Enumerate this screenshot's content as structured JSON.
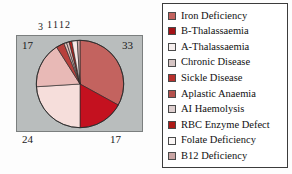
{
  "chart_data": {
    "type": "pie",
    "title": "",
    "legend_position": "right",
    "categories": [
      "Iron Deficiency",
      "B-Thalassaemia",
      "A-Thalassaemia",
      "Chronic Disease",
      "Sickle Disease",
      "Aplastic Anaemia",
      "AI Haemolysis",
      "RBC Enzyme Defect",
      "Folate Deficiency",
      "B12 Deficiency"
    ],
    "values": [
      33,
      17,
      24,
      17,
      3,
      1,
      1,
      1,
      2,
      1
    ],
    "colors": [
      "#c3635f",
      "#c4111f",
      "#f6dedb",
      "#e8b9b6",
      "#b8403c",
      "#e2c3c0",
      "#dfc0bd",
      "#b4231f",
      "#f7e7e5",
      "#cfa5a3"
    ],
    "slice_labels": {
      "iron_deficiency": "33",
      "b_thalassaemia": "17",
      "a_thalassaemia": "24",
      "chronic_disease": "17",
      "sickle_disease": "3",
      "aplastic_anaemia": "1",
      "ai_haemolysis": "1",
      "rbc_enzyme_defect": "1",
      "folate_deficiency": "2"
    },
    "plot_background": "#b9bdbd"
  },
  "legend": {
    "items": [
      {
        "label": "Iron Deficiency",
        "color": "#c3635f"
      },
      {
        "label": "B-Thalassaemia",
        "color": "#a31216"
      },
      {
        "label": "A-Thalassaemia",
        "color": "#f6efee"
      },
      {
        "label": "Chronic Disease",
        "color": "#d6c5c4"
      },
      {
        "label": "Sickle Disease",
        "color": "#b8302c"
      },
      {
        "label": "Aplastic Anaemia",
        "color": "#b4504c"
      },
      {
        "label": "AI Haemolysis",
        "color": "#decfcf"
      },
      {
        "label": "RBC Enzyme Defect",
        "color": "#ad1a17"
      },
      {
        "label": "Folate Deficiency",
        "color": "#faf6f5"
      },
      {
        "label": "B12 Deficiency",
        "color": "#c9a5a4"
      }
    ]
  }
}
